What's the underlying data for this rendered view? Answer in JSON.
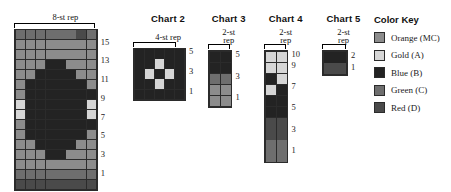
{
  "palette": {
    "MC": "#8c8c8c",
    "A": "#d6d6d6",
    "B": "#232323",
    "C": "#6e6e6e",
    "D": "#4a4a4a"
  },
  "color_key": {
    "title": "Color Key",
    "items": [
      {
        "code": "MC",
        "label": "Orange (MC)",
        "color": "#8c8c8c"
      },
      {
        "code": "A",
        "label": "Gold (A)",
        "color": "#d6d6d6"
      },
      {
        "code": "B",
        "label": "Blue (B)",
        "color": "#232323"
      },
      {
        "code": "C",
        "label": "Green (C)",
        "color": "#6e6e6e"
      },
      {
        "code": "D",
        "label": "Red (D)",
        "color": "#4a4a4a"
      }
    ]
  },
  "chart_data": [
    {
      "id": "chart1",
      "type": "heatmap",
      "title": "",
      "repeat_label": "8-st rep",
      "columns": 8,
      "rows": 16,
      "row_labels": [
        "15",
        "13",
        "11",
        "9",
        "7",
        "5",
        "3",
        "1"
      ],
      "row_label_rows": [
        15,
        13,
        11,
        9,
        7,
        5,
        3,
        1
      ],
      "grid_top_to_bottom": [
        [
          "C",
          "C",
          "C",
          "C",
          "C",
          "C",
          "D",
          "C"
        ],
        [
          "MC",
          "MC",
          "MC",
          "MC",
          "MC",
          "MC",
          "MC",
          "MC"
        ],
        [
          "MC",
          "MC",
          "MC",
          "MC",
          "MC",
          "MC",
          "MC",
          "MC"
        ],
        [
          "MC",
          "MC",
          "MC",
          "B",
          "B",
          "MC",
          "MC",
          "MC"
        ],
        [
          "MC",
          "MC",
          "B",
          "B",
          "B",
          "B",
          "MC",
          "MC"
        ],
        [
          "MC",
          "B",
          "B",
          "B",
          "B",
          "B",
          "B",
          "MC"
        ],
        [
          "MC",
          "B",
          "B",
          "B",
          "B",
          "B",
          "B",
          "B"
        ],
        [
          "A",
          "B",
          "B",
          "B",
          "B",
          "B",
          "B",
          "A"
        ],
        [
          "A",
          "B",
          "B",
          "B",
          "B",
          "B",
          "B",
          "A"
        ],
        [
          "MC",
          "B",
          "B",
          "B",
          "B",
          "B",
          "B",
          "B"
        ],
        [
          "MC",
          "B",
          "B",
          "B",
          "B",
          "B",
          "B",
          "MC"
        ],
        [
          "MC",
          "MC",
          "B",
          "B",
          "B",
          "B",
          "MC",
          "MC"
        ],
        [
          "MC",
          "MC",
          "MC",
          "B",
          "B",
          "MC",
          "MC",
          "MC"
        ],
        [
          "MC",
          "MC",
          "MC",
          "MC",
          "MC",
          "MC",
          "MC",
          "MC"
        ],
        [
          "C",
          "C",
          "C",
          "C",
          "C",
          "C",
          "C",
          "C"
        ],
        [
          "D",
          "D",
          "D",
          "D",
          "D",
          "D",
          "D",
          "D"
        ]
      ]
    },
    {
      "id": "chart2",
      "type": "heatmap",
      "title": "Chart 2",
      "repeat_label": "4-st rep",
      "columns": 5,
      "rows": 5,
      "row_labels": [
        "5",
        "3",
        "1"
      ],
      "row_label_rows": [
        5,
        3,
        1
      ],
      "grid_top_to_bottom": [
        [
          "B",
          "B",
          "B",
          "B",
          "B"
        ],
        [
          "B",
          "B",
          "A",
          "B",
          "B"
        ],
        [
          "B",
          "A",
          "B",
          "A",
          "B"
        ],
        [
          "B",
          "B",
          "A",
          "B",
          "B"
        ],
        [
          "B",
          "B",
          "B",
          "B",
          "B"
        ]
      ]
    },
    {
      "id": "chart3",
      "type": "heatmap",
      "title": "Chart 3",
      "repeat_label": "2-st rep",
      "columns": 2,
      "rows": 5,
      "row_labels": [
        "5",
        "3",
        "1"
      ],
      "row_label_rows": [
        5,
        3,
        1
      ],
      "grid_top_to_bottom": [
        [
          "B",
          "B"
        ],
        [
          "B",
          "B"
        ],
        [
          "C",
          "C"
        ],
        [
          "MC",
          "MC"
        ],
        [
          "MC",
          "MC"
        ]
      ]
    },
    {
      "id": "chart4",
      "type": "heatmap",
      "title": "Chart 4",
      "repeat_label": "2-st rep",
      "columns": 2,
      "rows": 10,
      "row_labels": [
        "10",
        "9",
        "7",
        "5",
        "3",
        "1"
      ],
      "row_label_rows": [
        10,
        9,
        7,
        5,
        3,
        1
      ],
      "grid_top_to_bottom": [
        [
          "A",
          "A"
        ],
        [
          "A",
          "A"
        ],
        [
          "B",
          "A"
        ],
        [
          "A",
          "B"
        ],
        [
          "B",
          "B"
        ],
        [
          "B",
          "B"
        ],
        [
          "D",
          "D"
        ],
        [
          "D",
          "D"
        ],
        [
          "C",
          "C"
        ],
        [
          "C",
          "C"
        ]
      ]
    },
    {
      "id": "chart5",
      "type": "heatmap",
      "title": "Chart 5",
      "repeat_label": "2-st rep",
      "columns": 2,
      "rows": 2,
      "row_labels": [
        "2",
        "1"
      ],
      "row_label_rows": [
        2,
        1
      ],
      "grid_top_to_bottom": [
        [
          "B",
          "B"
        ],
        [
          "D",
          "D"
        ]
      ]
    }
  ]
}
